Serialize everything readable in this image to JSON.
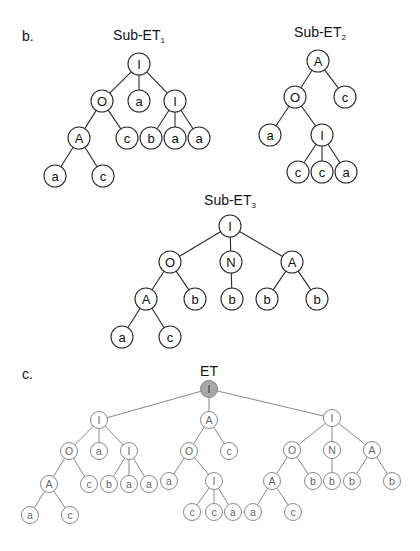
{
  "panels": {
    "b": {
      "label": "b.",
      "trees": [
        {
          "id": "sub_et_1",
          "title": "Sub-ET",
          "subscript": "1",
          "title_pos": [
            139,
            36
          ],
          "style": "dark",
          "nodes": [
            {
              "id": "n0",
              "label": "I",
              "x": 139,
              "y": 64
            },
            {
              "id": "n1",
              "label": "O",
              "x": 102,
              "y": 101,
              "parent": "n0"
            },
            {
              "id": "n2",
              "label": "a",
              "x": 139,
              "y": 101,
              "parent": "n0"
            },
            {
              "id": "n3",
              "label": "I",
              "x": 175,
              "y": 101,
              "parent": "n0"
            },
            {
              "id": "n4",
              "label": "A",
              "x": 79,
              "y": 138,
              "parent": "n1"
            },
            {
              "id": "n5",
              "label": "c",
              "x": 127,
              "y": 138,
              "parent": "n1"
            },
            {
              "id": "n6",
              "label": "b",
              "x": 151,
              "y": 138,
              "parent": "n3"
            },
            {
              "id": "n7",
              "label": "a",
              "x": 175,
              "y": 138,
              "parent": "n3"
            },
            {
              "id": "n8",
              "label": "a",
              "x": 199,
              "y": 138,
              "parent": "n3"
            },
            {
              "id": "n9",
              "label": "a",
              "x": 55,
              "y": 176,
              "parent": "n4"
            },
            {
              "id": "n10",
              "label": "c",
              "x": 103,
              "y": 176,
              "parent": "n4"
            }
          ]
        },
        {
          "id": "sub_et_2",
          "title": "Sub-ET",
          "subscript": "2",
          "title_pos": [
            320,
            33
          ],
          "style": "dark",
          "nodes": [
            {
              "id": "m0",
              "label": "A",
              "x": 318,
              "y": 61
            },
            {
              "id": "m1",
              "label": "O",
              "x": 295,
              "y": 97,
              "parent": "m0"
            },
            {
              "id": "m2",
              "label": "c",
              "x": 345,
              "y": 97,
              "parent": "m0"
            },
            {
              "id": "m3",
              "label": "a",
              "x": 270,
              "y": 135,
              "parent": "m1"
            },
            {
              "id": "m4",
              "label": "I",
              "x": 322,
              "y": 135,
              "parent": "m1"
            },
            {
              "id": "m5",
              "label": "c",
              "x": 298,
              "y": 172,
              "parent": "m4"
            },
            {
              "id": "m6",
              "label": "c",
              "x": 322,
              "y": 172,
              "parent": "m4"
            },
            {
              "id": "m7",
              "label": "a",
              "x": 346,
              "y": 172,
              "parent": "m4"
            }
          ]
        },
        {
          "id": "sub_et_3",
          "title": "Sub-ET",
          "subscript": "3",
          "title_pos": [
            230,
            201
          ],
          "style": "dark",
          "nodes": [
            {
              "id": "k0",
              "label": "I",
              "x": 230,
              "y": 226
            },
            {
              "id": "k1",
              "label": "O",
              "x": 170,
              "y": 262,
              "parent": "k0"
            },
            {
              "id": "k2",
              "label": "N",
              "x": 231,
              "y": 262,
              "parent": "k0"
            },
            {
              "id": "k3",
              "label": "A",
              "x": 292,
              "y": 262,
              "parent": "k0"
            },
            {
              "id": "k4",
              "label": "A",
              "x": 146,
              "y": 299,
              "parent": "k1"
            },
            {
              "id": "k5",
              "label": "b",
              "x": 195,
              "y": 299,
              "parent": "k1"
            },
            {
              "id": "k6",
              "label": "b",
              "x": 232,
              "y": 299,
              "parent": "k2"
            },
            {
              "id": "k7",
              "label": "b",
              "x": 267,
              "y": 299,
              "parent": "k3"
            },
            {
              "id": "k8",
              "label": "b",
              "x": 317,
              "y": 299,
              "parent": "k3"
            },
            {
              "id": "k9",
              "label": "a",
              "x": 122,
              "y": 337,
              "parent": "k4"
            },
            {
              "id": "k10",
              "label": "c",
              "x": 170,
              "y": 337,
              "parent": "k4"
            }
          ]
        }
      ]
    },
    "c": {
      "label": "c.",
      "trees": [
        {
          "id": "et",
          "title": "ET",
          "subscript": "",
          "title_pos": [
            209,
            372
          ],
          "style": "light",
          "nodes": [
            {
              "id": "r",
              "label": "I",
              "x": 209,
              "y": 389,
              "root_filled": true
            },
            {
              "id": "p0",
              "label": "I",
              "x": 99,
              "y": 420,
              "parent": "r"
            },
            {
              "id": "p1",
              "label": "O",
              "x": 69,
              "y": 451,
              "parent": "p0"
            },
            {
              "id": "p2",
              "label": "a",
              "x": 99,
              "y": 451,
              "parent": "p0"
            },
            {
              "id": "p3",
              "label": "I",
              "x": 129,
              "y": 451,
              "parent": "p0"
            },
            {
              "id": "p4",
              "label": "A",
              "x": 49,
              "y": 484,
              "parent": "p1"
            },
            {
              "id": "p5",
              "label": "c",
              "x": 89,
              "y": 484,
              "parent": "p1"
            },
            {
              "id": "p6",
              "label": "b",
              "x": 109,
              "y": 484,
              "parent": "p3"
            },
            {
              "id": "p7",
              "label": "a",
              "x": 129,
              "y": 484,
              "parent": "p3"
            },
            {
              "id": "p8",
              "label": "a",
              "x": 149,
              "y": 484,
              "parent": "p3"
            },
            {
              "id": "p9",
              "label": "a",
              "x": 30,
              "y": 515,
              "parent": "p4"
            },
            {
              "id": "p10",
              "label": "c",
              "x": 70,
              "y": 515,
              "parent": "p4"
            },
            {
              "id": "q0",
              "label": "A",
              "x": 209,
              "y": 420,
              "parent": "r"
            },
            {
              "id": "q1",
              "label": "O",
              "x": 189,
              "y": 451,
              "parent": "q0"
            },
            {
              "id": "q2",
              "label": "c",
              "x": 229,
              "y": 451,
              "parent": "q0"
            },
            {
              "id": "q3",
              "label": "a",
              "x": 169,
              "y": 481,
              "parent": "q1"
            },
            {
              "id": "q4",
              "label": "I",
              "x": 214,
              "y": 481,
              "parent": "q1"
            },
            {
              "id": "q5",
              "label": "c",
              "x": 192,
              "y": 512,
              "parent": "q4"
            },
            {
              "id": "q6",
              "label": "c",
              "x": 214,
              "y": 512,
              "parent": "q4"
            },
            {
              "id": "q7",
              "label": "a",
              "x": 233,
              "y": 512,
              "parent": "q4"
            },
            {
              "id": "s0",
              "label": "I",
              "x": 332,
              "y": 418,
              "parent": "r"
            },
            {
              "id": "s1",
              "label": "O",
              "x": 292,
              "y": 450,
              "parent": "s0"
            },
            {
              "id": "s2",
              "label": "N",
              "x": 332,
              "y": 450,
              "parent": "s0"
            },
            {
              "id": "s3",
              "label": "A",
              "x": 372,
              "y": 450,
              "parent": "s0"
            },
            {
              "id": "s4",
              "label": "A",
              "x": 272,
              "y": 481,
              "parent": "s1"
            },
            {
              "id": "s5",
              "label": "b",
              "x": 313,
              "y": 481,
              "parent": "s1"
            },
            {
              "id": "s6",
              "label": "b",
              "x": 332,
              "y": 481,
              "parent": "s2"
            },
            {
              "id": "s7",
              "label": "b",
              "x": 352,
              "y": 481,
              "parent": "s3"
            },
            {
              "id": "s8",
              "label": "b",
              "x": 392,
              "y": 481,
              "parent": "s3"
            },
            {
              "id": "s9",
              "label": "a",
              "x": 253,
              "y": 512,
              "parent": "s4"
            },
            {
              "id": "s10",
              "label": "c",
              "x": 293,
              "y": 512,
              "parent": "s4"
            }
          ]
        }
      ]
    }
  },
  "colors": {
    "dark_stroke": "#2a2a2a",
    "dark_text": "#111111",
    "light_stroke": "#7a7a7a",
    "light_text": "#666666",
    "root_fill": "#a8a8a8",
    "background": "#ffffff"
  }
}
